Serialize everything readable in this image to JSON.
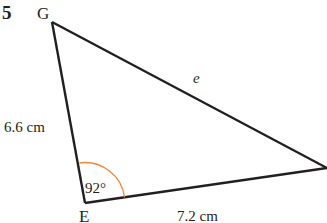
{
  "question_number": "5",
  "vertices": {
    "G": {
      "label": "G",
      "x": 52,
      "y": 22
    },
    "E": {
      "label": "E",
      "x": 85,
      "y": 203
    },
    "F": {
      "label": "",
      "x": 327,
      "y": 168
    }
  },
  "sides": {
    "GE": {
      "label": "6.6 cm"
    },
    "EF": {
      "label": "7.2 cm"
    },
    "GF": {
      "label": "e"
    }
  },
  "angle_E": {
    "label": "92°",
    "arc_color": "#f0883a"
  },
  "colors": {
    "line": "#231f20",
    "text": "#231f20",
    "background": "#ffffff"
  }
}
